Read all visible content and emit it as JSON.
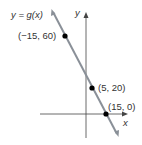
{
  "diagram": {
    "function_label": "y = g(x)",
    "x_axis_label": "x",
    "y_axis_label": "y",
    "line_color": "#8a9098",
    "axis_color": "#444444",
    "point_color": "#000000",
    "points": [
      {
        "label": "(−15, 60)",
        "x": -15,
        "y": 60
      },
      {
        "label": "(5, 20)",
        "x": 5,
        "y": 20
      },
      {
        "label": "(15, 0)",
        "x": 15,
        "y": 0
      }
    ]
  }
}
